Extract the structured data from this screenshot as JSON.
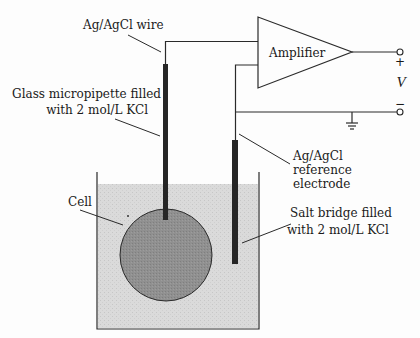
{
  "diagram": {
    "type": "electrophysiology-setup",
    "labels": {
      "wire": "Ag/AgCl wire",
      "micropipette_line1": "Glass micropipette filled",
      "micropipette_line2": "with 2 mol/L KCl",
      "amplifier": "Amplifier",
      "reference_line1": "Ag/AgCl",
      "reference_line2": "reference",
      "reference_line3": "electrode",
      "salt_bridge_line1": "Salt bridge filled",
      "salt_bridge_line2": "with 2 mol/L KCl",
      "cell": "Cell",
      "voltage": "V",
      "plus": "+",
      "minus": "−"
    },
    "colors": {
      "ink": "#2a2a2a",
      "bath": "#d9d9d9",
      "cell": "#8e8e8e",
      "electrode": "#262626",
      "background": "#fdfdfd"
    }
  }
}
